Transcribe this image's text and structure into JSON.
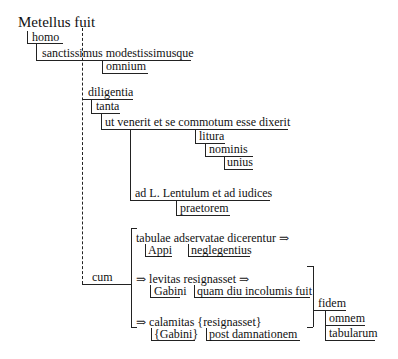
{
  "diagram": {
    "type": "sentence-structure",
    "root": "Metellus fuit",
    "nodes": {
      "homo": "homo",
      "sanctissimus": "sanctissimus modestissimusque",
      "omnium": "omnium",
      "diligentia": "diligentia",
      "tanta": "tanta",
      "ut_venerit": "ut venerit et se commotum esse dixerit",
      "litura": "litura",
      "nominis": "nominis",
      "unius": "unius",
      "ad_lentulum": "ad L. Lentulum et ad iudices",
      "praetorem": "praetorem",
      "cum": "cum",
      "tabulae": "tabulae adservatae dicerentur ⇒",
      "appi": "Appi",
      "neglegentius": "neglegentius",
      "levitas": "⇒ levitas  resignasset ⇒",
      "gabini": "Gabini",
      "quam_diu": "quam diu incolumis fuit",
      "calamitas": "⇒ calamitas  {resignasset}",
      "gabini_braced": "{Gabini}",
      "post_damnationem": "post damnationem",
      "fidem": "fidem",
      "omnem": "omnem",
      "tabularum": "tabularum"
    }
  }
}
